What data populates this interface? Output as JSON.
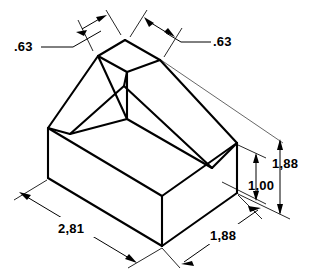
{
  "drawing": {
    "title": "Isometric dimensioned part",
    "background_color": "#ffffff",
    "line_color": "#000000",
    "object_stroke_width": 2.1,
    "dimension_stroke_width": 1.0,
    "units_note": "",
    "dimensions": [
      {
        "id": "chamfer-left",
        "value": ".63",
        "label_x": 22,
        "label_y": 50,
        "orientation": "isometric-top-left",
        "description": "Left top chamfer width"
      },
      {
        "id": "chamfer-right",
        "value": ".63",
        "label_x": 215,
        "label_y": 55,
        "orientation": "isometric-top-right",
        "description": "Right top chamfer width"
      },
      {
        "id": "overall-height",
        "value": "1,88",
        "label_x": 276,
        "label_y": 165,
        "orientation": "vertical",
        "description": "Overall height of part"
      },
      {
        "id": "base-height",
        "value": "1,00",
        "label_x": 252,
        "label_y": 188,
        "orientation": "vertical",
        "description": "Height of rectangular base block"
      },
      {
        "id": "base-length",
        "value": "2,81",
        "label_x": 62,
        "label_y": 233,
        "orientation": "isometric-bottom-left",
        "description": "Length of base along left axis"
      },
      {
        "id": "base-width",
        "value": "1,88",
        "label_x": 215,
        "label_y": 239,
        "orientation": "isometric-bottom-right",
        "description": "Width of base along right axis"
      }
    ],
    "geometry": {
      "top_face": {
        "name": "top-ridge-face",
        "points": "125,40 160,60 127,72 98,56"
      },
      "base_block": {
        "name": "base-block",
        "left_corner": "48,128",
        "front_corner": "162,196",
        "right_corner": "237,143",
        "back_corner": "124,86",
        "height_px": 50
      }
    }
  }
}
